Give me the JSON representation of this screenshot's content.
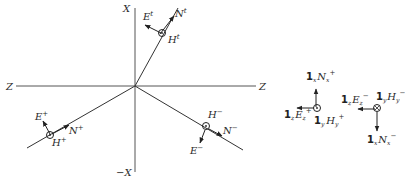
{
  "diagram": {
    "type": "wave reflection/transmission vector diagram",
    "axes": {
      "x_pos": "X",
      "x_neg": "−X",
      "z_left": "Z",
      "z_right": "Z"
    },
    "transmitted_wave": {
      "E": "E",
      "E_sup": "t",
      "N": "N",
      "N_sup": "t",
      "H": "H",
      "H_sup": "t"
    },
    "incident_wave": {
      "E": "E",
      "E_sup": "+",
      "N": "N",
      "N_sup": "+",
      "H": "H",
      "H_sup": "+"
    },
    "reflected_wave": {
      "E": "E",
      "E_sup": "−",
      "N": "N",
      "N_sup": "−",
      "H": "H",
      "H_sup": "−"
    },
    "incident_components": {
      "N_unit": "1",
      "N_unit_sub": "x",
      "N": "N",
      "N_sub": "x",
      "N_sup": "+",
      "E_unit": "1",
      "E_unit_sub": "z",
      "E": "E",
      "E_sub": "z",
      "E_sup": "+",
      "H_unit": "1",
      "H_unit_sub": "y",
      "H": "H",
      "H_sub": "y",
      "H_sup": "+"
    },
    "reflected_components": {
      "E_unit": "1",
      "E_unit_sub": "z",
      "E": "E",
      "E_sub": "z",
      "E_sup": "−",
      "H_unit": "1",
      "H_unit_sub": "y",
      "H": "H",
      "H_sub": "y",
      "H_sup": "−",
      "N_unit": "1",
      "N_unit_sub": "x",
      "N": "N",
      "N_sub": "x",
      "N_sup": "−"
    }
  }
}
